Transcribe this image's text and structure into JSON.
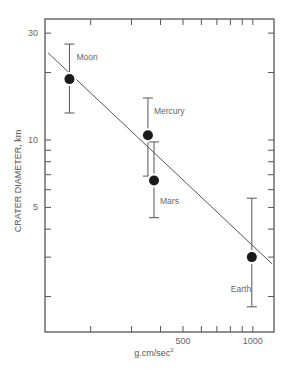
{
  "chart_data": {
    "type": "scatter",
    "title": "",
    "xlabel": "g.cm/sec²",
    "ylabel": "CRATER DIAMETER, km",
    "xscale": "log",
    "yscale": "log",
    "xlim": [
      127,
      1250
    ],
    "ylim": [
      1.4,
      35
    ],
    "grid": false,
    "legend": null,
    "x_ticks_major": [
      {
        "value": 500,
        "label": "500"
      },
      {
        "value": 1000,
        "label": "1000"
      }
    ],
    "x_ticks_minor": [
      200,
      300,
      400,
      600,
      700,
      800,
      900
    ],
    "y_ticks_major": [
      {
        "value": 30,
        "label": "30"
      },
      {
        "value": 10,
        "label": "10"
      },
      {
        "value": 5,
        "label": "5"
      }
    ],
    "y_ticks_minor": [
      20,
      9,
      8,
      7,
      6,
      4,
      3,
      2
    ],
    "series": [
      {
        "name": "Planetary bodies",
        "points": [
          {
            "label": "Moon",
            "x": 162,
            "y": 18.7,
            "y_err_low": 13.2,
            "y_err_high": 26.8
          },
          {
            "label": "Mercury",
            "x": 353,
            "y": 10.5,
            "y_err_low": 6.9,
            "y_err_high": 15.4
          },
          {
            "label": "Mars",
            "x": 375,
            "y": 6.6,
            "y_err_low": 4.5,
            "y_err_high": 9.8
          },
          {
            "label": "Earth",
            "x": 990,
            "y": 3.0,
            "y_err_low": 1.8,
            "y_err_high": 5.5
          }
        ]
      }
    ],
    "fit_line": {
      "x_start": 131,
      "y_start": 24.5,
      "x_end": 1210,
      "y_end": 2.8
    }
  },
  "colors": {
    "axis": "#555555",
    "marker": "#1a1a1a",
    "line": "#555555",
    "text": "#666666"
  }
}
